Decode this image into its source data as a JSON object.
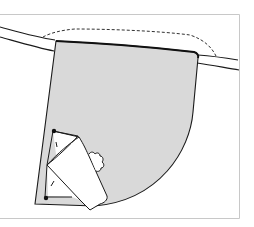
{
  "figure": {
    "colors": {
      "background": "#ffffff",
      "frame": "#c8c8c8",
      "outline": "#1a1a1a",
      "pocket_fill": "#d9d9d9",
      "flap_fill": "#ffffff"
    },
    "elements": [
      "frame",
      "waistband",
      "pocket",
      "dashed-guide-line",
      "folded-flap",
      "pin-markers"
    ]
  }
}
